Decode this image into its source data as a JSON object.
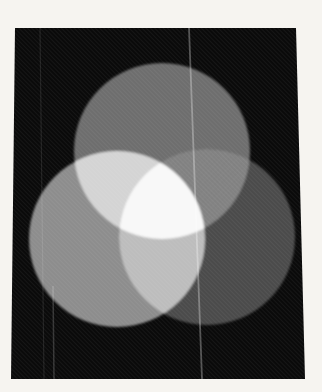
{
  "page": {
    "margin_color": "#f6f4f0"
  },
  "photo": {
    "background_color": "#0a0a0a"
  },
  "figure": {
    "type": "grayscale additive light mixing (three overlapping disks)",
    "circles": [
      {
        "name": "top-circle",
        "cx": 151,
        "cy": 123,
        "r": 88,
        "fill": "#6e6e6e"
      },
      {
        "name": "left-circle",
        "cx": 106,
        "cy": 211,
        "r": 88,
        "fill": "#8d8d8d"
      },
      {
        "name": "right-circle",
        "cx": 196,
        "cy": 209,
        "r": 88,
        "fill": "#4c4c4c"
      }
    ],
    "overlaps": {
      "top_left": "#d4d4d4",
      "top_right": "#7b7b7b",
      "left_right": "#bdbdbd",
      "center": "#f8f8f8"
    },
    "texture": {
      "moire_opacity": 0.1,
      "grain_opacity": 0.05
    },
    "scratches": [
      {
        "x1": 178,
        "y1": 0,
        "x2": 191,
        "y2": 351,
        "color": "#ffffff",
        "opacity": 0.3,
        "width": 1.8
      },
      {
        "x1": 29,
        "y1": 0,
        "x2": 33,
        "y2": 351,
        "color": "#ffffff",
        "opacity": 0.1,
        "width": 1.2
      },
      {
        "x1": 42,
        "y1": 258,
        "x2": 43,
        "y2": 351,
        "color": "#ffffff",
        "opacity": 0.18,
        "width": 1.5
      }
    ]
  }
}
